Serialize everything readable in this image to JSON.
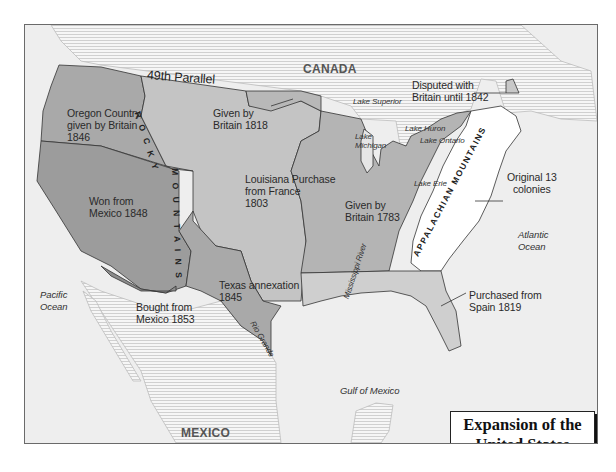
{
  "title": {
    "line1": "Expansion of the",
    "line2": "United States"
  },
  "countries": {
    "canada": "CANADA",
    "mexico": "MEXICO"
  },
  "boundary": {
    "parallel": "49th Parallel"
  },
  "territories": [
    {
      "id": "oregon",
      "line1": "Oregon Country,",
      "line2": "given by Britain",
      "line3": "1846",
      "color": "#a9a9a9"
    },
    {
      "id": "britain1818",
      "line1": "Given by",
      "line2": "Britain 1818",
      "color": "#c4c4c4"
    },
    {
      "id": "louisiana",
      "line1": "Louisiana Purchase",
      "line2": "from France",
      "line3": "1803",
      "color": "#c4c4c4"
    },
    {
      "id": "mexico1848",
      "line1": "Won from",
      "line2": "Mexico 1848",
      "color": "#9c9c9c"
    },
    {
      "id": "texas",
      "line1": "Texas annexation",
      "line2": "1845",
      "color": "#a9a9a9"
    },
    {
      "id": "gadsden",
      "line1": "Bought from",
      "line2": "Mexico 1853",
      "color": "#8c8c8c"
    },
    {
      "id": "britain1783",
      "line1": "Given by",
      "line2": "Britain 1783",
      "color": "#b4b4b4"
    },
    {
      "id": "maine",
      "line1": "Disputed with",
      "line2": "Britain until 1842",
      "color": "#c8c8c8"
    },
    {
      "id": "colonies",
      "line1": "Original 13",
      "line2": "colonies",
      "color": "#ffffff"
    },
    {
      "id": "florida",
      "line1": "Purchased from",
      "line2": "Spain 1819",
      "color": "#cfcfcf"
    }
  ],
  "water": {
    "pacific_1": "Pacific",
    "pacific_2": "Ocean",
    "atlantic_1": "Atlantic",
    "atlantic_2": "Ocean",
    "gulf": "Gulf of Mexico",
    "superior": "Lake Superior",
    "huron": "Lake Huron",
    "ontario": "Lake Ontario",
    "michigan_1": "Lake",
    "michigan_2": "Michigan",
    "erie": "Lake Erie"
  },
  "features": {
    "rocky_1": "R O C K Y",
    "rocky_2": "M O U N T A I N S",
    "appalachian": "APPALACHIAN MOUNTAINS",
    "mississippi": "Mississippi River",
    "rio_grande": "Rio Grande"
  },
  "colors": {
    "frame_border": "#6a6a6a",
    "ocean": "#eeeeee",
    "foreign_land_hatch": "#f4f4f4",
    "hatch_line": "#c8c8c8",
    "border_line": "#333333"
  }
}
